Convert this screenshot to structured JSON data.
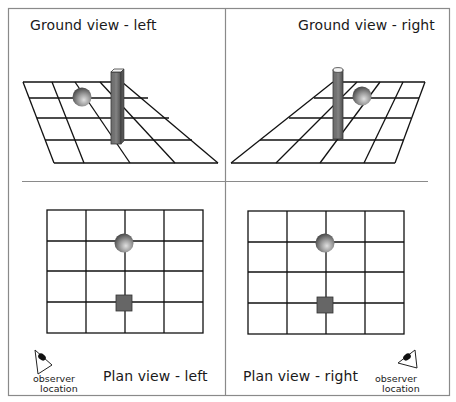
{
  "figure": {
    "colors": {
      "frame": "#8a8a8a",
      "grid": "#111111",
      "pillar_dark": "#5e5e5e",
      "pillar_light": "#8c8c8c",
      "pillar_top": "#f2f2f2",
      "sphere_light": "#d8d8d8",
      "sphere_dark": "#4a4a4a",
      "square_fill": "#666666"
    },
    "panels": {
      "ground_left": {
        "title": "Ground view - left"
      },
      "ground_right": {
        "title": "Ground view - right"
      },
      "plan_left": {
        "title": "Plan view - left",
        "observer_label_line1": "observer",
        "observer_label_line2": "location",
        "grid": {
          "cols": 4,
          "rows": 4
        },
        "sphere_cell": "column line 3, row line 2",
        "square_cell": "column line 3, row line 4"
      },
      "plan_right": {
        "title": "Plan view - right",
        "observer_label_line1": "observer",
        "observer_label_line2": "location",
        "grid": {
          "cols": 4,
          "rows": 4
        },
        "sphere_cell": "column line 3, row line 2",
        "square_cell": "column line 3, row line 4"
      }
    }
  }
}
